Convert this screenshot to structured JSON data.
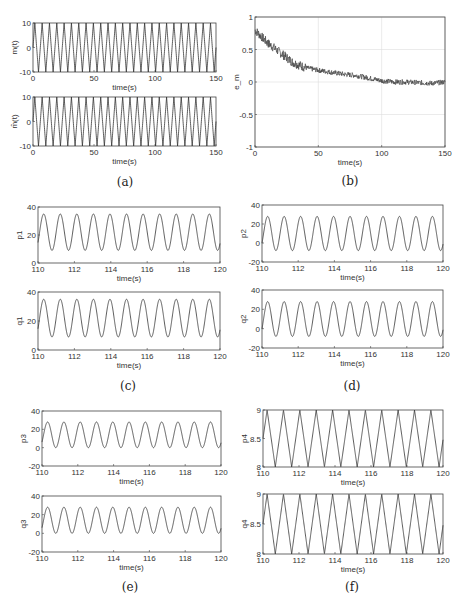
{
  "chart_data": [
    {
      "panel": "(a)",
      "type": "line",
      "subplots": [
        {
          "ylabel": "m(t)",
          "xlabel": "time(s)",
          "xlim": [
            0,
            150
          ],
          "ylim": [
            -10,
            10
          ],
          "xticks": [
            0,
            50,
            100,
            150
          ],
          "yticks": [
            -10,
            0,
            10
          ],
          "series": {
            "kind": "triangle-wave",
            "amplitude": 10,
            "cycles": 25
          }
        },
        {
          "ylabel": "m̂(t)",
          "xlabel": "time(s)",
          "xlim": [
            0,
            150
          ],
          "ylim": [
            -10,
            10
          ],
          "xticks": [
            0,
            50,
            100,
            150
          ],
          "yticks": [
            -10,
            0,
            10
          ],
          "series": {
            "kind": "triangle-wave",
            "amplitude": 10,
            "cycles": 25
          }
        }
      ]
    },
    {
      "panel": "(b)",
      "type": "line",
      "ylabel": "e_m",
      "xlabel": "time(s)",
      "xlim": [
        0,
        150
      ],
      "ylim": [
        -1,
        1
      ],
      "xticks": [
        0,
        50,
        100,
        150
      ],
      "yticks": [
        -1,
        -0.5,
        0,
        0.5,
        1
      ],
      "grid": true,
      "x": [
        0,
        5,
        10,
        20,
        30,
        40,
        50,
        60,
        70,
        80,
        90,
        100,
        110,
        120,
        130,
        140,
        150
      ],
      "values": [
        0.8,
        0.7,
        0.6,
        0.45,
        0.3,
        0.22,
        0.18,
        0.15,
        0.12,
        0.1,
        0.06,
        0.02,
        0.0,
        0.0,
        -0.01,
        -0.02,
        0.0
      ],
      "noise": 0.04
    },
    {
      "panel": "(c)",
      "type": "line",
      "subplots": [
        {
          "ylabel": "p1",
          "xlabel": "time(s)",
          "xlim": [
            110,
            120
          ],
          "ylim": [
            0,
            40
          ],
          "xticks": [
            110,
            112,
            114,
            116,
            118,
            120
          ],
          "yticks": [
            0,
            20,
            40
          ],
          "series": {
            "kind": "sine",
            "mean": 22,
            "amplitude": 13,
            "period": 0.91
          }
        },
        {
          "ylabel": "q1",
          "xlabel": "time(s)",
          "xlim": [
            110,
            120
          ],
          "ylim": [
            0,
            40
          ],
          "xticks": [
            110,
            112,
            114,
            116,
            118,
            120
          ],
          "yticks": [
            0,
            20,
            40
          ],
          "series": {
            "kind": "sine",
            "mean": 22,
            "amplitude": 13,
            "period": 0.91
          }
        }
      ]
    },
    {
      "panel": "(d)",
      "type": "line",
      "subplots": [
        {
          "ylabel": "p2",
          "xlabel": "time(s)",
          "xlim": [
            110,
            120
          ],
          "ylim": [
            -20,
            40
          ],
          "xticks": [
            110,
            112,
            114,
            116,
            118,
            120
          ],
          "yticks": [
            -20,
            0,
            20,
            40
          ],
          "series": {
            "kind": "sine",
            "mean": 10,
            "amplitude": 18,
            "period": 0.91
          }
        },
        {
          "ylabel": "q2",
          "xlabel": "time(s)",
          "xlim": [
            110,
            120
          ],
          "ylim": [
            -20,
            40
          ],
          "xticks": [
            110,
            112,
            114,
            116,
            118,
            120
          ],
          "yticks": [
            -20,
            0,
            20,
            40
          ],
          "series": {
            "kind": "sine",
            "mean": 10,
            "amplitude": 18,
            "period": 0.91
          }
        }
      ]
    },
    {
      "panel": "(e)",
      "type": "line",
      "subplots": [
        {
          "ylabel": "p3",
          "xlabel": "time(s)",
          "xlim": [
            110,
            120
          ],
          "ylim": [
            -20,
            40
          ],
          "xticks": [
            110,
            112,
            114,
            116,
            118,
            120
          ],
          "yticks": [
            -20,
            0,
            20,
            40
          ],
          "series": {
            "kind": "sine",
            "mean": 14,
            "amplitude": 14,
            "period": 0.91
          }
        },
        {
          "ylabel": "q3",
          "xlabel": "time(s)",
          "xlim": [
            110,
            120
          ],
          "ylim": [
            -20,
            40
          ],
          "xticks": [
            110,
            112,
            114,
            116,
            118,
            120
          ],
          "yticks": [
            -20,
            0,
            20,
            40
          ],
          "series": {
            "kind": "sine",
            "mean": 14,
            "amplitude": 14,
            "period": 0.91
          }
        }
      ]
    },
    {
      "panel": "(f)",
      "type": "line",
      "subplots": [
        {
          "ylabel": "p4",
          "xlabel": "time(s)",
          "xlim": [
            110,
            120
          ],
          "ylim": [
            8,
            9
          ],
          "xticks": [
            110,
            112,
            114,
            116,
            118,
            120
          ],
          "yticks": [
            8,
            8.5,
            9
          ],
          "series": {
            "kind": "triangle-wave",
            "mean": 8.5,
            "amplitude": 0.5,
            "period": 0.91
          }
        },
        {
          "ylabel": "q4",
          "xlabel": "time(s)",
          "xlim": [
            110,
            120
          ],
          "ylim": [
            8,
            9
          ],
          "xticks": [
            110,
            112,
            114,
            116,
            118,
            120
          ],
          "yticks": [
            8,
            8.5,
            9
          ],
          "series": {
            "kind": "triangle-wave",
            "mean": 8.5,
            "amplitude": 0.5,
            "period": 0.91
          }
        }
      ]
    }
  ],
  "captions": {
    "a": "(a)",
    "b": "(b)",
    "c": "(c)",
    "d": "(d)",
    "e": "(e)",
    "f": "(f)"
  }
}
